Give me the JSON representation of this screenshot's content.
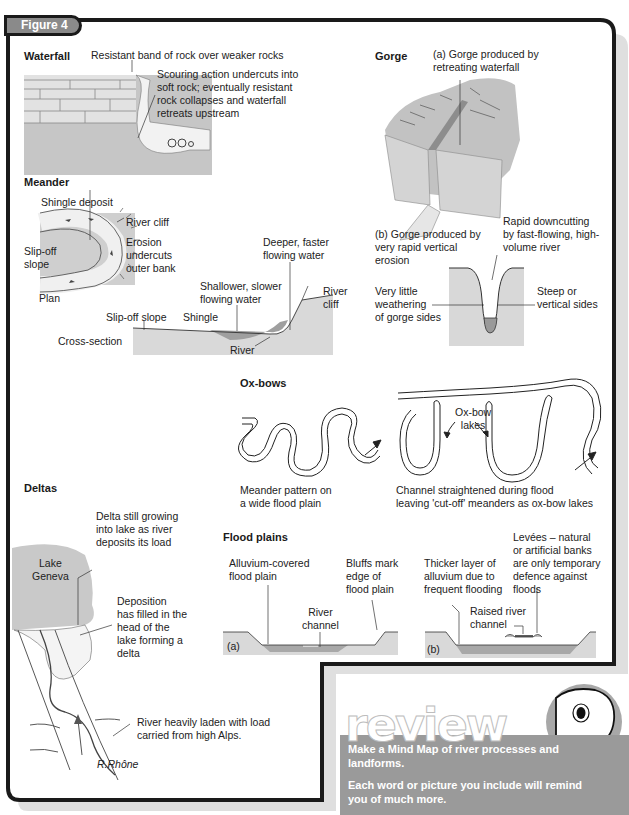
{
  "figure": {
    "label": "Figure 4"
  },
  "colors": {
    "frame": "#1a1a1a",
    "rock_fill": "#c8c8c8",
    "water": "#e9e9e9",
    "review_band": "#9a9a9a",
    "shadow": "#bdbdbd"
  },
  "waterfall": {
    "title": "Waterfall",
    "labels": [
      "Resistant band of rock over weaker rocks",
      "Scouring action undercuts into\nsoft rock; eventually resistant\nrock collapses and waterfall\nretreats upstream"
    ]
  },
  "gorge": {
    "title": "Gorge",
    "a_label": "(a) Gorge produced by\n      retreating waterfall",
    "b_label": "(b) Gorge produced by\n      very rapid vertical\n      erosion",
    "downcutting": "Rapid downcutting\nby fast-flowing, high-\nvolume river",
    "weathering": "Very little\nweathering\nof gorge sides",
    "steep": "Steep or\nvertical sides"
  },
  "meander": {
    "title": "Meander",
    "shingle_deposit": "Shingle deposit",
    "river_cliff": "River cliff",
    "slip_off": "Slip-off\nslope",
    "erosion": "Erosion\nundercuts\nouter bank",
    "plan": "Plan",
    "deeper": "Deeper, faster\nflowing water",
    "shallower": "Shallower, slower\nflowing water",
    "river_cliff_cs": "River\ncliff",
    "slip_off_cs": "Slip-off slope",
    "shingle": "Shingle",
    "cross_section": "Cross-section",
    "river": "River"
  },
  "oxbows": {
    "title": "Ox-bows",
    "lakes": "Ox-bow\nlakes",
    "caption_left": "Meander pattern on\na wide flood plain",
    "caption_right": "Channel straightened during flood\nleaving 'cut-off' meanders as ox-bow lakes"
  },
  "deltas": {
    "title": "Deltas",
    "lake": "Lake\nGeneva",
    "growing": "Delta still growing\ninto lake as river\ndeposits its load",
    "deposition": "Deposition\nhas filled in the\nhead of the\nlake forming a\ndelta",
    "laden": "River heavily laden with load\ncarried from high Alps.",
    "river_name": "R.Rhône"
  },
  "floodplains": {
    "title": "Flood plains",
    "a": {
      "alluvium": "Alluvium-covered\nflood plain",
      "bluffs": "Bluffs mark\nedge of\nflood plain",
      "channel": "River\nchannel",
      "tag": "(a)"
    },
    "b": {
      "thicker": "Thicker layer of\nalluvium due to\nfrequent flooding",
      "levees": "Levées – natural\nor artificial banks\nare only temporary\ndefence against\nfloods",
      "raised": "Raised river\nchannel",
      "tag": "(b)"
    }
  },
  "review": {
    "heading": "review",
    "line1": "Make a Mind Map of river processes and\nlandforms.",
    "line2": "Each word or picture you include will remind\nyou of much more."
  }
}
